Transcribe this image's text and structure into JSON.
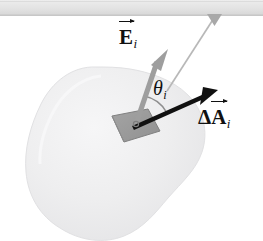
{
  "figure": {
    "name": "electric-flux-through-surface-element",
    "background_color": "#ffffff",
    "width": 263,
    "height": 241
  },
  "scan_band": {
    "name": "top-scan-band",
    "color": "#e4e4e4",
    "edge_color": "#b9b9b9",
    "height": 16
  },
  "surface": {
    "name": "closed-gaussian-surface",
    "fill_color": "#ececed",
    "edge_color": "#e0e0e1",
    "shading_color": "#f4f4f5"
  },
  "patch": {
    "name": "area-element-patch",
    "fill_color": "#9b9b9b",
    "edge_color": "#7c7c7c",
    "label": ""
  },
  "vectors": [
    {
      "id": "E",
      "name": "electric-field-vector",
      "color": "#9d9d9d",
      "label_text": "E",
      "label_subscript": "i",
      "has_overarrow": true,
      "tail": [
        136,
        123
      ],
      "tip": [
        160,
        52
      ]
    },
    {
      "id": "dA",
      "name": "area-vector",
      "color": "#111111",
      "label_delta": "Δ",
      "label_text": "A",
      "label_subscript": "i",
      "has_overarrow": true,
      "tail": [
        133,
        128
      ],
      "tip": [
        215,
        92
      ]
    }
  ],
  "angle": {
    "name": "angle-theta-i",
    "symbol": "θ",
    "subscript": "i",
    "arc_color": "#8e8e8e",
    "vertex": [
      136,
      124
    ]
  },
  "leader": {
    "name": "leader-line-to-surface",
    "color": "#b6b6b6",
    "arrowhead_color": "#a9a9a9",
    "from": [
      215,
      16
    ],
    "to": [
      167,
      90
    ]
  },
  "labels": {
    "E_field": {
      "base": "E",
      "subscript": "i"
    },
    "theta": {
      "base": "θ",
      "subscript": "i"
    },
    "delta_A": {
      "delta": "Δ",
      "base": "A",
      "subscript": "i"
    }
  }
}
